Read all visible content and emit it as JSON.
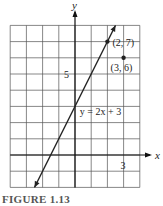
{
  "chart_data": {
    "type": "line",
    "title": "",
    "caption": "FIGURE 1.13",
    "xlabel": "x",
    "ylabel": "y",
    "xlim": [
      -4,
      4
    ],
    "ylim": [
      -2,
      8
    ],
    "grid": true,
    "grid_step": 1,
    "tick_labels": {
      "x": [
        {
          "value": 3,
          "label": "3"
        }
      ],
      "y": [
        {
          "value": 5,
          "label": "5"
        }
      ]
    },
    "series": [
      {
        "name": "y = 2x + 3",
        "equation": "y = 2x + 3",
        "slope": 2,
        "intercept": 3,
        "x": [
          -2.5,
          2.5
        ],
        "y": [
          -2,
          8
        ]
      }
    ],
    "points": [
      {
        "x": 2,
        "y": 7,
        "label": "(2, 7)"
      },
      {
        "x": 3,
        "y": 6,
        "label": "(3, 6)"
      }
    ],
    "annotations": [
      {
        "text": "y = 2x + 3",
        "x": 0.3,
        "y": 2.5
      }
    ]
  }
}
